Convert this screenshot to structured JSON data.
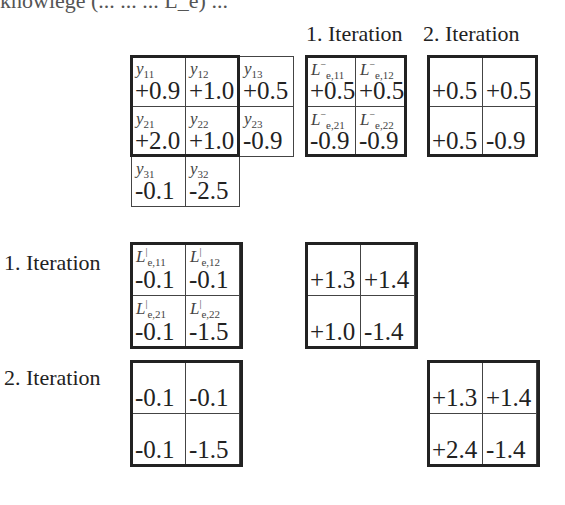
{
  "top_fragment": "knowlege (... ... ... L_e) ...",
  "column_headers": [
    "1. Iteration",
    "2. Iteration"
  ],
  "row_labels": [
    "1. Iteration",
    "2. Iteration"
  ],
  "y_matrix": {
    "symbols": [
      [
        "y11",
        "y12",
        "y13"
      ],
      [
        "y21",
        "y22",
        "y23"
      ],
      [
        "y31",
        "y32",
        ""
      ]
    ],
    "values": [
      [
        "+0.9",
        "+1.0",
        "+0.5"
      ],
      [
        "+2.0",
        "+1.0",
        "-0.9"
      ],
      [
        "-0.1",
        "-2.5",
        ""
      ]
    ]
  },
  "Le_minus_iter1": {
    "symbols": [
      [
        "L⁻e,11",
        "L⁻e,12"
      ],
      [
        "L⁻e,21",
        "L⁻e,22"
      ]
    ],
    "values": [
      [
        "+0.5",
        "+0.5"
      ],
      [
        "-0.9",
        "-0.9"
      ]
    ]
  },
  "Le_minus_iter2": {
    "values": [
      [
        "+0.5",
        "+0.5"
      ],
      [
        "+0.5",
        "-0.9"
      ]
    ]
  },
  "Le_bar_iter1": {
    "symbols": [
      [
        "L|e,11",
        "L|e,12"
      ],
      [
        "L|e,21",
        "L|e,22"
      ]
    ],
    "values": [
      [
        "-0.1",
        "-0.1"
      ],
      [
        "-0.1",
        "-1.5"
      ]
    ]
  },
  "sum_iter1": {
    "values": [
      [
        "+1.3",
        "+1.4"
      ],
      [
        "+1.0",
        "-1.4"
      ]
    ]
  },
  "Le_bar_iter2": {
    "values": [
      [
        "-0.1",
        "-0.1"
      ],
      [
        "-0.1",
        "-1.5"
      ]
    ]
  },
  "sum_iter2": {
    "values": [
      [
        "+1.3",
        "+1.4"
      ],
      [
        "+2.4",
        "-1.4"
      ]
    ]
  }
}
